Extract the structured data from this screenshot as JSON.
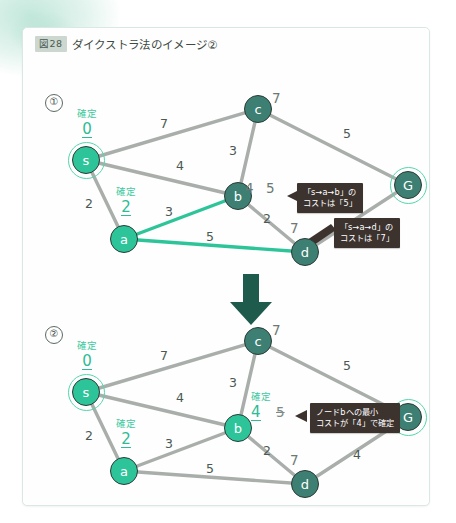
{
  "figure": {
    "badge": "図28",
    "caption": "ダイクストラ法のイメージ②"
  },
  "steps": [
    {
      "number": "①"
    },
    {
      "number": "②"
    }
  ],
  "icons": {
    "transition_arrow": "down-arrow-icon"
  },
  "colors": {
    "node_confirmed": "#2ec49a",
    "node_plain": "#3d7f72",
    "edge_default": "#a9aeab",
    "edge_highlight": "#2ec49a",
    "callout_bg": "#3c322e",
    "confirm_text": "#2ebb95",
    "tentative_text": "#6b7873",
    "arrow": "#1f5b4c",
    "badge_bg": "#ccd8cf"
  },
  "labels": {
    "confirmed_keyword": "確定"
  },
  "graph_top": {
    "step_number": "①",
    "nodes": [
      {
        "id": "s",
        "label": "s",
        "style": "bright-ring",
        "confirmed": true,
        "confirmed_keyword": "確定",
        "cost": "0"
      },
      {
        "id": "a",
        "label": "a",
        "style": "bright",
        "confirmed": true,
        "confirmed_keyword": "確定",
        "cost": "2"
      },
      {
        "id": "b",
        "label": "b",
        "style": "dark",
        "confirmed": false,
        "tentative": [
          "4",
          "5"
        ]
      },
      {
        "id": "c",
        "label": "c",
        "style": "dark",
        "confirmed": false,
        "tentative": [
          "7"
        ]
      },
      {
        "id": "d",
        "label": "d",
        "style": "dark",
        "confirmed": false,
        "tentative": [
          "7"
        ]
      },
      {
        "id": "G",
        "label": "G",
        "style": "dark-ring",
        "confirmed": false,
        "tentative": []
      }
    ],
    "edges": [
      {
        "from": "s",
        "to": "c",
        "weight": "7",
        "highlight": false
      },
      {
        "from": "s",
        "to": "b",
        "weight": "4",
        "highlight": false
      },
      {
        "from": "s",
        "to": "a",
        "weight": "2",
        "highlight": false
      },
      {
        "from": "a",
        "to": "b",
        "weight": "3",
        "highlight": true
      },
      {
        "from": "a",
        "to": "d",
        "weight": "5",
        "highlight": true
      },
      {
        "from": "c",
        "to": "b",
        "weight": "3",
        "highlight": false
      },
      {
        "from": "c",
        "to": "G",
        "weight": "5",
        "highlight": false
      },
      {
        "from": "b",
        "to": "d",
        "weight": "2",
        "highlight": false
      },
      {
        "from": "d",
        "to": "G",
        "weight": "4",
        "highlight": false
      }
    ],
    "callouts": [
      {
        "id": "callout-ab",
        "line1": "「s→a→b」の",
        "line2": "コストは「5」"
      },
      {
        "id": "callout-ad",
        "line1": "「s→a→d」の",
        "line2": "コストは「7」"
      }
    ]
  },
  "graph_bottom": {
    "step_number": "②",
    "nodes": [
      {
        "id": "s",
        "label": "s",
        "style": "bright-ring",
        "confirmed": true,
        "confirmed_keyword": "確定",
        "cost": "0"
      },
      {
        "id": "a",
        "label": "a",
        "style": "bright",
        "confirmed": true,
        "confirmed_keyword": "確定",
        "cost": "2"
      },
      {
        "id": "b",
        "label": "b",
        "style": "bright",
        "confirmed": true,
        "confirmed_keyword": "確定",
        "cost": "4",
        "struck": "5"
      },
      {
        "id": "c",
        "label": "c",
        "style": "dark",
        "confirmed": false,
        "tentative": [
          "7"
        ]
      },
      {
        "id": "d",
        "label": "d",
        "style": "dark",
        "confirmed": false,
        "tentative": [
          "7"
        ]
      },
      {
        "id": "G",
        "label": "G",
        "style": "dark-ring",
        "confirmed": false,
        "tentative": []
      }
    ],
    "edges": [
      {
        "from": "s",
        "to": "c",
        "weight": "7",
        "highlight": false
      },
      {
        "from": "s",
        "to": "b",
        "weight": "4",
        "highlight": false
      },
      {
        "from": "s",
        "to": "a",
        "weight": "2",
        "highlight": false
      },
      {
        "from": "a",
        "to": "b",
        "weight": "3",
        "highlight": false
      },
      {
        "from": "a",
        "to": "d",
        "weight": "5",
        "highlight": false
      },
      {
        "from": "c",
        "to": "b",
        "weight": "3",
        "highlight": false
      },
      {
        "from": "c",
        "to": "G",
        "weight": "5",
        "highlight": false
      },
      {
        "from": "b",
        "to": "d",
        "weight": "2",
        "highlight": false
      },
      {
        "from": "d",
        "to": "G",
        "weight": "4",
        "highlight": false
      }
    ],
    "callouts": [
      {
        "id": "callout-b-confirmed",
        "line1": "ノードbへの最小",
        "line2": "コストが「4」で確定"
      }
    ]
  }
}
